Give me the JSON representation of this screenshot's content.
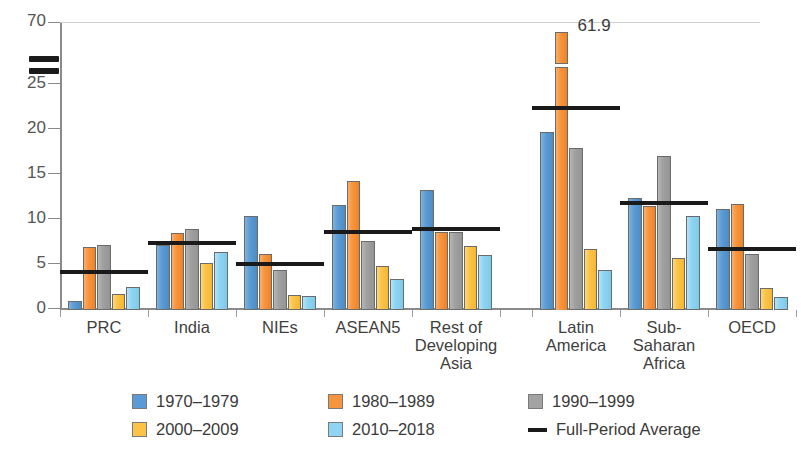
{
  "chart_data": {
    "type": "bar",
    "title": "",
    "subtitle": "",
    "xlabel": "",
    "ylabel": "",
    "ylim": [
      0,
      70
    ],
    "y_axis_break": {
      "from": 25,
      "to": 70,
      "note": "axis broken between 25 and 70"
    },
    "grid": false,
    "legend_position": "bottom",
    "yticks": [
      "0",
      "5",
      "10",
      "15",
      "20",
      "25",
      "70"
    ],
    "categories": [
      "PRC",
      "India",
      "NIEs",
      "ASEAN5",
      "Rest of Developing Asia",
      "Latin America",
      "Sub-Saharan Africa",
      "OECD"
    ],
    "category_label_lines": [
      [
        "PRC"
      ],
      [
        "India"
      ],
      [
        "NIEs"
      ],
      [
        "ASEAN5"
      ],
      [
        "Rest of",
        "Developing",
        "Asia"
      ],
      [
        "Latin",
        "America"
      ],
      [
        "Sub-",
        "Saharan",
        "Africa"
      ],
      [
        "OECD"
      ]
    ],
    "series": [
      {
        "name": "1970–1979",
        "color": "#5b9bd5",
        "values": [
          1.0,
          7.2,
          10.4,
          11.7,
          13.3,
          19.8,
          12.4,
          11.2
        ]
      },
      {
        "name": "1980–1989",
        "color": "#f7943e",
        "values": [
          7.0,
          8.6,
          6.2,
          14.3,
          8.7,
          61.9,
          11.6,
          11.8
        ]
      },
      {
        "name": "1990–1999",
        "color": "#a3a3a3",
        "values": [
          7.2,
          9.0,
          4.5,
          7.7,
          8.7,
          18.0,
          17.1,
          6.2
        ]
      },
      {
        "name": "2000–2009",
        "color": "#fbc449",
        "values": [
          1.8,
          5.2,
          1.7,
          4.9,
          7.1,
          6.8,
          5.8,
          2.5
        ]
      },
      {
        "name": "2010–2018",
        "color": "#8fd4f2",
        "values": [
          2.6,
          6.5,
          1.6,
          3.5,
          6.1,
          4.4,
          10.5,
          1.4
        ]
      }
    ],
    "full_period_average": {
      "name": "Full-Period Average",
      "color": "#1a1a1a",
      "values": [
        4.0,
        7.2,
        4.9,
        8.4,
        8.8,
        22.2,
        11.7,
        6.6
      ]
    },
    "data_labels": [
      {
        "category": "Latin America",
        "series": "1980–1989",
        "text": "61.9"
      }
    ],
    "annotations": [
      "Axis break marks drawn on the y-axis between 25 and 70",
      "Orange bar for Latin America 1980–1989 is truncated with a break"
    ]
  },
  "legend": {
    "items": [
      {
        "label": "1970–1979",
        "swatch": "c0",
        "type": "box"
      },
      {
        "label": "1980–1989",
        "swatch": "c1",
        "type": "box"
      },
      {
        "label": "1990–1999",
        "swatch": "c2",
        "type": "box"
      },
      {
        "label": "2000–2009",
        "swatch": "c3",
        "type": "box"
      },
      {
        "label": "2010–2018",
        "swatch": "c4",
        "type": "box"
      },
      {
        "label": "Full-Period Average",
        "swatch": "line",
        "type": "line"
      }
    ]
  }
}
